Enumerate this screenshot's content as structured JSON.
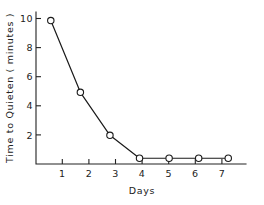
{
  "chart_data": {
    "type": "line",
    "title": "",
    "xlabel": "Days",
    "ylabel": "Time to Quieten ( minutes )",
    "x": [
      1,
      2,
      3,
      4,
      5,
      6,
      7
    ],
    "values": [
      10,
      5,
      2,
      0.4,
      0.4,
      0.4,
      0.4
    ],
    "series": [
      {
        "name": "Time to Quieten",
        "values": [
          10,
          5,
          2,
          0.4,
          0.4,
          0.4,
          0.4
        ]
      }
    ],
    "xtick_labels": [
      "1",
      "2",
      "3",
      "4",
      "5",
      "6",
      "7"
    ],
    "ytick_labels": [
      "2",
      "4",
      "6",
      "8",
      "10"
    ],
    "ytick_values": [
      2,
      4,
      6,
      8,
      10
    ],
    "xlim": [
      0.5,
      7.6
    ],
    "ylim": [
      0,
      10.6
    ],
    "grid": false,
    "legend": false,
    "marker": "open-circle",
    "line_color": "#1a1a1a",
    "background_color": "#ffffff"
  },
  "figure": {
    "axis_color": "#222222",
    "text_color": "#222222"
  }
}
